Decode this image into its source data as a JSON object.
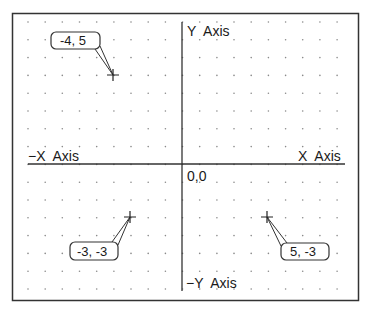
{
  "diagram": {
    "frame": {
      "x": 12,
      "y": 13,
      "width": 346,
      "height": 287,
      "stroke": "#333333"
    },
    "grid": {
      "x_start": 28,
      "x_step": 17.17,
      "columns": 19,
      "y_start": 22,
      "y_step": 17.8,
      "rows": 16,
      "dot_color": "#8a8a8a"
    },
    "origin": {
      "px": 182,
      "py": 164,
      "unit_x": 17.17,
      "unit_y": 17.8
    },
    "axes": {
      "x_line": {
        "x1": 28,
        "x2": 345,
        "y": 164
      },
      "y_line": {
        "x": 182,
        "y1": 22,
        "y2": 291
      },
      "labels": {
        "pos_y": "Y  Axis",
        "neg_y": "−Y  Axis",
        "pos_x": "X  Axis",
        "neg_x": "−X  Axis",
        "origin": "0,0"
      }
    },
    "points": [
      {
        "x": -4,
        "y": 5,
        "label": "-4, 5",
        "box": {
          "x": 51,
          "y": 32,
          "w": 49,
          "h": 17
        }
      },
      {
        "x": -3,
        "y": -3,
        "label": "-3, -3",
        "box": {
          "x": 70,
          "y": 242,
          "w": 48,
          "h": 18
        }
      },
      {
        "x": 5,
        "y": -3,
        "label": "5, -3",
        "box": {
          "x": 281,
          "y": 243,
          "w": 48,
          "h": 17
        }
      }
    ],
    "marker": "plus-cross"
  }
}
